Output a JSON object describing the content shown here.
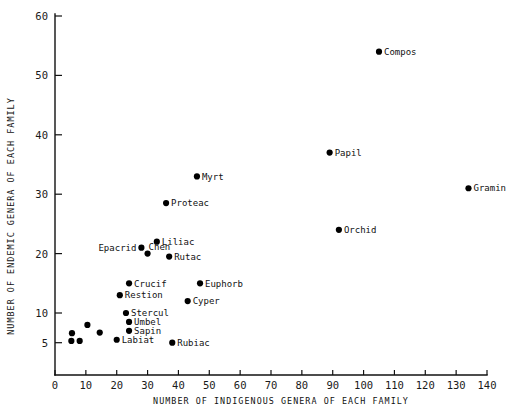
{
  "chart_data": {
    "type": "scatter",
    "title": "",
    "xlabel": "NUMBER OF INDIGENOUS GENERA OF EACH FAMILY",
    "ylabel": "NUMBER OF ENDEMIC GENERA OF EACH FAMILY",
    "xlim": [
      0,
      140
    ],
    "ylim": [
      3,
      60
    ],
    "xticks": [
      0,
      10,
      20,
      30,
      40,
      50,
      60,
      70,
      80,
      90,
      100,
      110,
      120,
      130,
      140
    ],
    "yticks": [
      5,
      10,
      20,
      30,
      40,
      50,
      60
    ],
    "xticklabels": [
      "0",
      "10",
      "20",
      "30",
      "40",
      "50",
      "60",
      "70",
      "80",
      "90",
      "100",
      "110",
      "120",
      "130",
      "140"
    ],
    "yticklabels": [
      "5",
      "10",
      "20",
      "30",
      "40",
      "50",
      "60"
    ],
    "grid": false,
    "legend": false,
    "marker": "filled-circle",
    "marker_color": "#000000",
    "points": [
      {
        "label": "Gramin",
        "x": 134,
        "y": 31.0,
        "label_pos": "right"
      },
      {
        "label": "Compos",
        "x": 105,
        "y": 54.0,
        "label_pos": "right"
      },
      {
        "label": "Papil",
        "x": 89,
        "y": 37.0,
        "label_pos": "right"
      },
      {
        "label": "Orchid",
        "x": 92,
        "y": 24.0,
        "label_pos": "right"
      },
      {
        "label": "Myrt",
        "x": 46,
        "y": 33.0,
        "label_pos": "right"
      },
      {
        "label": "Proteac",
        "x": 36,
        "y": 28.5,
        "label_pos": "right"
      },
      {
        "label": "Liliac",
        "x": 33,
        "y": 22.0,
        "label_pos": "right"
      },
      {
        "label": "Epacrid",
        "x": 28,
        "y": 21.0,
        "label_pos": "left"
      },
      {
        "label": "Chen",
        "x": 30,
        "y": 20.0,
        "label_pos": "above-right"
      },
      {
        "label": "Rutac",
        "x": 37,
        "y": 19.5,
        "label_pos": "right"
      },
      {
        "label": "Euphorb",
        "x": 47,
        "y": 15.0,
        "label_pos": "right"
      },
      {
        "label": "Crucif",
        "x": 24,
        "y": 15.0,
        "label_pos": "right"
      },
      {
        "label": "Restion",
        "x": 21,
        "y": 13.0,
        "label_pos": "right"
      },
      {
        "label": "Cyper",
        "x": 43,
        "y": 12.0,
        "label_pos": "right"
      },
      {
        "label": "Stercul",
        "x": 23,
        "y": 10.0,
        "label_pos": "right"
      },
      {
        "label": "Umbel",
        "x": 24,
        "y": 8.5,
        "label_pos": "right"
      },
      {
        "label": "Sapin",
        "x": 24,
        "y": 7.0,
        "label_pos": "right"
      },
      {
        "label": "Labiat",
        "x": 20,
        "y": 5.5,
        "label_pos": "right"
      },
      {
        "label": "Rubiac",
        "x": 38,
        "y": 5.0,
        "label_pos": "right"
      },
      {
        "label": "",
        "x": 10.5,
        "y": 8.0,
        "label_pos": "none"
      },
      {
        "label": "",
        "x": 14.5,
        "y": 6.7,
        "label_pos": "none"
      },
      {
        "label": "",
        "x": 5.5,
        "y": 6.6,
        "label_pos": "none"
      },
      {
        "label": "",
        "x": 5.3,
        "y": 5.3,
        "label_pos": "none"
      },
      {
        "label": "",
        "x": 8.0,
        "y": 5.3,
        "label_pos": "none"
      }
    ]
  }
}
